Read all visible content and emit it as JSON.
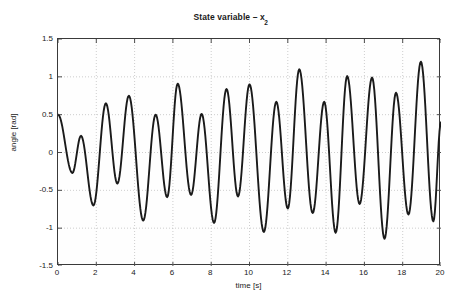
{
  "chart_data": {
    "type": "line",
    "title": "State variable – x",
    "title_subscript": "2",
    "xlabel": "time [s]",
    "ylabel": "angle [rad]",
    "xlim": [
      0,
      20
    ],
    "ylim": [
      -1.5,
      1.5
    ],
    "xticks": [
      0,
      2,
      4,
      6,
      8,
      10,
      12,
      14,
      16,
      18,
      20
    ],
    "xtick_labels": [
      "0",
      "2",
      "4",
      "6",
      "8",
      "10",
      "12",
      "14",
      "16",
      "18",
      "20"
    ],
    "yticks": [
      1.5,
      1,
      0.5,
      0,
      -0.5,
      -1,
      -1.5
    ],
    "ytick_labels": [
      "1.5",
      "1",
      "0.5",
      "0",
      "-0.5",
      "-1",
      "-1.5"
    ],
    "grid": true,
    "grid_style": "dotted",
    "legend": null,
    "line_color": "#1a1a1a",
    "line_width": 1.9,
    "series": [
      {
        "name": "x2",
        "comment": "Oscillatory state response with growing envelope; extrema read off the axes.",
        "extrema": [
          {
            "t": 0.0,
            "v": 0.5
          },
          {
            "t": 0.75,
            "v": -0.27
          },
          {
            "t": 1.2,
            "v": 0.22
          },
          {
            "t": 1.85,
            "v": -0.7
          },
          {
            "t": 2.5,
            "v": 0.65
          },
          {
            "t": 3.1,
            "v": -0.41
          },
          {
            "t": 3.7,
            "v": 0.75
          },
          {
            "t": 4.45,
            "v": -0.9
          },
          {
            "t": 5.1,
            "v": 0.5
          },
          {
            "t": 5.7,
            "v": -0.59
          },
          {
            "t": 6.25,
            "v": 0.91
          },
          {
            "t": 6.95,
            "v": -0.56
          },
          {
            "t": 7.5,
            "v": 0.51
          },
          {
            "t": 8.15,
            "v": -0.93
          },
          {
            "t": 8.8,
            "v": 0.84
          },
          {
            "t": 9.4,
            "v": -0.58
          },
          {
            "t": 10.0,
            "v": 0.9
          },
          {
            "t": 10.75,
            "v": -1.05
          },
          {
            "t": 11.4,
            "v": 0.67
          },
          {
            "t": 12.0,
            "v": -0.74
          },
          {
            "t": 12.6,
            "v": 1.1
          },
          {
            "t": 13.3,
            "v": -0.8
          },
          {
            "t": 13.9,
            "v": 0.67
          },
          {
            "t": 14.5,
            "v": -1.06
          },
          {
            "t": 15.1,
            "v": 1.01
          },
          {
            "t": 15.75,
            "v": -0.68
          },
          {
            "t": 16.4,
            "v": 0.99
          },
          {
            "t": 17.05,
            "v": -1.14
          },
          {
            "t": 17.65,
            "v": 0.79
          },
          {
            "t": 18.3,
            "v": -0.82
          },
          {
            "t": 18.95,
            "v": 1.2
          },
          {
            "t": 19.6,
            "v": -0.91
          },
          {
            "t": 20.0,
            "v": 0.4
          }
        ]
      }
    ]
  },
  "figure": {
    "background_color": "#ffffff",
    "axes_color": "#3a3a3a",
    "grid_color": "#b9b9b9",
    "text_color": "#1a1a1a"
  }
}
